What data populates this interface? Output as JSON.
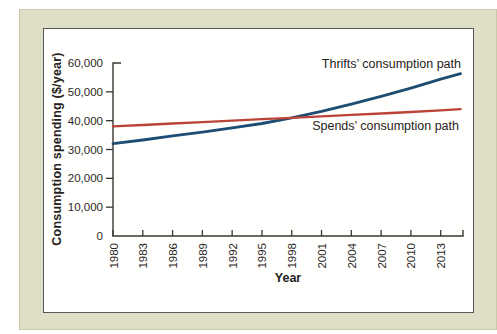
{
  "colors": {
    "page_background": "#ffffff",
    "panel_background": "#dfdec6",
    "panel_border": "#c9c8ac",
    "chart_background": "#fffffe",
    "chart_frame_border": "#56575b",
    "axis": "#3a3633",
    "text": "#2b2724",
    "thrifts_line": "#1d4d73",
    "spends_line": "#bc4338"
  },
  "chart_data": {
    "type": "line",
    "title": "",
    "xlabel": "Year",
    "ylabel": "Consumption spending ($/year)",
    "xlim": [
      1980,
      2015.2
    ],
    "ylim": [
      0,
      60000
    ],
    "grid": false,
    "legend": "inline annotations next to each line",
    "axis_color": "#3a3633",
    "x_ticks": [
      1980,
      1983,
      1986,
      1989,
      1992,
      1995,
      1998,
      2001,
      2004,
      2007,
      2010,
      2013
    ],
    "x_tick_label_rotation_deg": -90,
    "y_ticks": [
      {
        "value": 0,
        "label": "0"
      },
      {
        "value": 10000,
        "label": "10,000"
      },
      {
        "value": 20000,
        "label": "20,000"
      },
      {
        "value": 30000,
        "label": "30,000"
      },
      {
        "value": 40000,
        "label": "40,000"
      },
      {
        "value": 50000,
        "label": "50,000"
      },
      {
        "value": 60000,
        "label": "60,000"
      }
    ],
    "series": [
      {
        "name": "Thrifts’ consumption path",
        "color": "#1d4d73",
        "stroke_width": 2.8,
        "points": [
          [
            1980,
            32000
          ],
          [
            1983,
            33300
          ],
          [
            1986,
            34700
          ],
          [
            1989,
            36000
          ],
          [
            1992,
            37500
          ],
          [
            1995,
            39000
          ],
          [
            1998,
            41000
          ],
          [
            2001,
            43200
          ],
          [
            2004,
            45700
          ],
          [
            2007,
            48400
          ],
          [
            2010,
            51300
          ],
          [
            2013,
            54400
          ],
          [
            2015,
            56300
          ]
        ]
      },
      {
        "name": "Spends’ consumption path",
        "color": "#bc4338",
        "stroke_width": 2.3,
        "points": [
          [
            1980,
            38000
          ],
          [
            1983,
            38500
          ],
          [
            1986,
            39000
          ],
          [
            1989,
            39500
          ],
          [
            1992,
            40000
          ],
          [
            1995,
            40500
          ],
          [
            1998,
            41000
          ],
          [
            2001,
            41500
          ],
          [
            2004,
            42000
          ],
          [
            2007,
            42500
          ],
          [
            2010,
            43000
          ],
          [
            2013,
            43600
          ],
          [
            2015,
            44000
          ]
        ]
      }
    ]
  }
}
